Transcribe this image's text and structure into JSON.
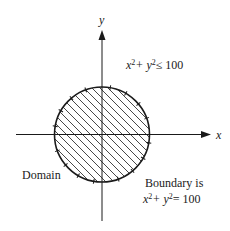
{
  "diagram": {
    "axes": {
      "x_label": "x",
      "y_label": "y"
    },
    "region": {
      "shape": "disk",
      "center": [
        0,
        0
      ],
      "radius": 10,
      "fill": "diagonal-hatch"
    },
    "labels": {
      "inequality_lhs": "x",
      "inequality_mid": "+ y",
      "inequality_rhs": "≤ 100",
      "sup": "2",
      "domain": "Domain",
      "boundary_line1": "Boundary is",
      "boundary_lhs": "x",
      "boundary_mid": "+ y",
      "boundary_rhs": "= 100"
    },
    "colors": {
      "ink": "#1a1a1a",
      "background": "#ffffff"
    }
  }
}
